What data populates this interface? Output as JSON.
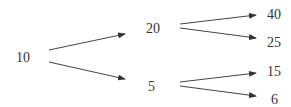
{
  "diagram": {
    "type": "tree",
    "nodes": [
      {
        "id": "root",
        "label": "10"
      },
      {
        "id": "up",
        "label": "20"
      },
      {
        "id": "down",
        "label": "5"
      },
      {
        "id": "upup",
        "label": "40"
      },
      {
        "id": "updown",
        "label": "25"
      },
      {
        "id": "downup",
        "label": "15"
      },
      {
        "id": "downdown",
        "label": "6"
      }
    ],
    "edges": [
      {
        "from": "root",
        "to": "up"
      },
      {
        "from": "root",
        "to": "down"
      },
      {
        "from": "up",
        "to": "upup"
      },
      {
        "from": "up",
        "to": "updown"
      },
      {
        "from": "down",
        "to": "downup"
      },
      {
        "from": "down",
        "to": "downdown"
      }
    ]
  }
}
